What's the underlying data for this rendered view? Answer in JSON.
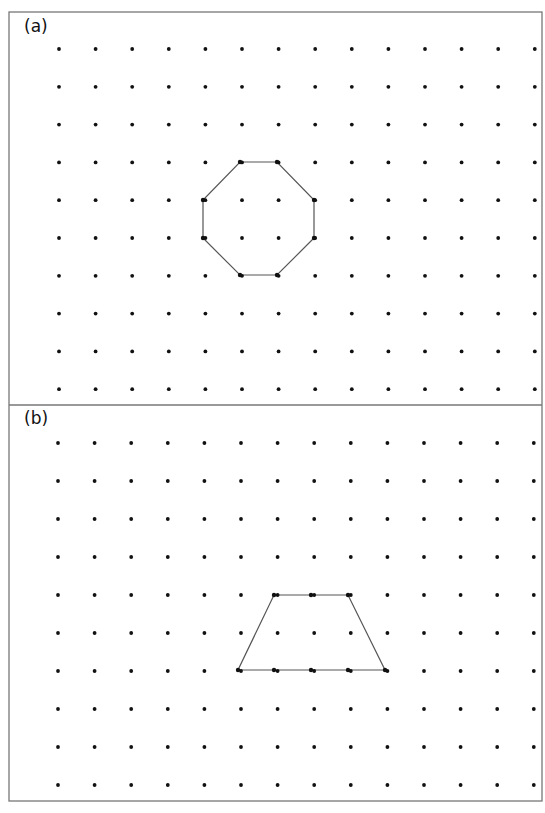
{
  "panels": [
    {
      "label": "(a)",
      "shape": "octagon",
      "grid": {
        "cols": 14,
        "rows": 10,
        "x0": 59,
        "dx": 36.6,
        "y0": 49,
        "dy": 37.8
      },
      "polygon": [
        [
          240,
          162
        ],
        [
          277,
          162
        ],
        [
          314,
          200
        ],
        [
          314,
          238
        ],
        [
          277,
          275
        ],
        [
          240,
          275
        ],
        [
          203,
          238
        ],
        [
          203,
          200
        ]
      ]
    },
    {
      "label": "(b)",
      "shape": "trapezoid",
      "grid": {
        "cols": 14,
        "rows": 10,
        "x0": 58,
        "dx": 36.6,
        "y0": 443,
        "dy": 38
      },
      "polygon": [
        [
          274,
          595
        ],
        [
          348,
          595
        ],
        [
          385,
          670
        ],
        [
          238,
          670
        ]
      ],
      "extra_vertices": [
        [
          311,
          595
        ],
        [
          274,
          670
        ],
        [
          311,
          670
        ],
        [
          348,
          670
        ]
      ]
    }
  ],
  "colors": {
    "line": "#555555",
    "dot": "#111111",
    "border": "#777777"
  }
}
